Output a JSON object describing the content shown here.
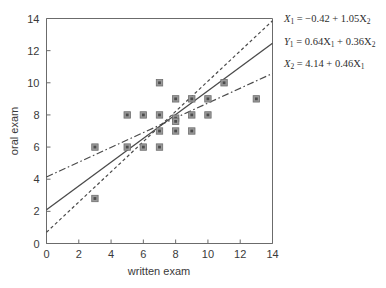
{
  "chart_data": {
    "type": "scatter",
    "title": "",
    "xlabel": "written exam",
    "ylabel": "oral exam",
    "xlim": [
      0,
      14
    ],
    "ylim": [
      0,
      14
    ],
    "xticks": [
      0,
      2,
      4,
      6,
      8,
      10,
      12,
      14
    ],
    "yticks": [
      0,
      2,
      4,
      6,
      8,
      10,
      12,
      14
    ],
    "grid": false,
    "legend": "none",
    "points": [
      {
        "x": 3,
        "y": 6
      },
      {
        "x": 3,
        "y": 2.8
      },
      {
        "x": 5,
        "y": 8
      },
      {
        "x": 5,
        "y": 6
      },
      {
        "x": 6,
        "y": 8
      },
      {
        "x": 6,
        "y": 6
      },
      {
        "x": 7,
        "y": 10
      },
      {
        "x": 7,
        "y": 8
      },
      {
        "x": 7,
        "y": 7
      },
      {
        "x": 7,
        "y": 6
      },
      {
        "x": 8,
        "y": 9
      },
      {
        "x": 8,
        "y": 7.8
      },
      {
        "x": 8,
        "y": 7.6
      },
      {
        "x": 8,
        "y": 7
      },
      {
        "x": 9,
        "y": 9
      },
      {
        "x": 9,
        "y": 8
      },
      {
        "x": 9,
        "y": 7
      },
      {
        "x": 10,
        "y": 9
      },
      {
        "x": 10,
        "y": 8
      },
      {
        "x": 11,
        "y": 10
      },
      {
        "x": 13,
        "y": 9
      }
    ],
    "lines": [
      {
        "name": "x1-on-x2-regression",
        "style": "dotted",
        "intercept": 0.7,
        "slope": 0.94,
        "x_range": [
          0,
          14
        ],
        "equation_label": "X1 = -0.42 + 1.05X2"
      },
      {
        "name": "bisector-line",
        "style": "solid",
        "intercept": 2.1,
        "slope": 0.74,
        "x_range": [
          0,
          14
        ],
        "equation_label": "Y1 = 0.64X1 + 0.36X2"
      },
      {
        "name": "x2-on-x1-regression",
        "style": "dash-dot",
        "intercept": 4.14,
        "slope": 0.46,
        "x_range": [
          0,
          14
        ],
        "equation_label": "X2 = 4.14 + 0.46X1"
      }
    ],
    "annotations": [
      {
        "id": "eq1",
        "lhs": "X",
        "lhs_sub": "1",
        "rhs": " = −0.42 + 1.05X",
        "rhs_sub": "2"
      },
      {
        "id": "eq2",
        "lhs": "Y",
        "lhs_sub": "1",
        "rhs": " = 0.64X",
        "rhs_sub": "1",
        "rhs2": " + 0.36X",
        "rhs2_sub": "2"
      },
      {
        "id": "eq3",
        "lhs": "X",
        "lhs_sub": "2",
        "rhs": " = 4.14 + 0.46X",
        "rhs_sub": "1"
      }
    ]
  },
  "axes": {
    "x_label": "written exam",
    "y_label": "oral exam",
    "x_tick_labels": [
      "0",
      "2",
      "4",
      "6",
      "8",
      "10",
      "12",
      "14"
    ],
    "y_tick_labels": [
      "0",
      "2",
      "4",
      "6",
      "8",
      "10",
      "12",
      "14"
    ]
  },
  "equations": {
    "eq1_x": "X",
    "eq1_x_sub": "1",
    "eq1_body": " = −0.42 + 1.05X",
    "eq1_body_sub": "2",
    "eq2_y": "Y",
    "eq2_y_sub": "1",
    "eq2_body_a": " = 0.64X",
    "eq2_body_a_sub": "1",
    "eq2_body_b": " + 0.36X",
    "eq2_body_b_sub": "2",
    "eq3_x": "X",
    "eq3_x_sub": "2",
    "eq3_body": " = 4.14 + 0.46X",
    "eq3_body_sub": "1"
  },
  "colors": {
    "axis": "#6b6b6b",
    "marker_fill": "#9a9a9a",
    "marker_core": "#4c4c4c",
    "line": "#4a4a4a",
    "text": "#3a3a3a",
    "background": "#ffffff"
  }
}
